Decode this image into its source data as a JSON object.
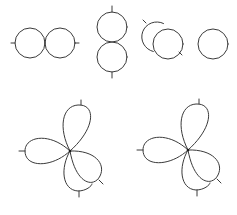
{
  "diagram": {
    "background": "#ffffff",
    "stroke_color": "#3a3a3a",
    "row1": {
      "pair_horizontal": {
        "circles": [
          {
            "cx": 30,
            "cy": 43,
            "r": 15
          },
          {
            "cx": 60,
            "cy": 43,
            "r": 15
          }
        ],
        "ticks": [
          {
            "x1": 11,
            "y1": 43,
            "x2": 15,
            "y2": 43
          },
          {
            "x1": 75,
            "y1": 43,
            "x2": 79,
            "y2": 43
          }
        ]
      },
      "pair_vertical": {
        "circles": [
          {
            "cx": 112,
            "cy": 27,
            "r": 15
          },
          {
            "cx": 112,
            "cy": 57,
            "r": 15
          }
        ],
        "ticks": [
          {
            "x1": 112,
            "y1": 6,
            "x2": 112,
            "y2": 12
          },
          {
            "x1": 112,
            "y1": 72,
            "x2": 112,
            "y2": 78
          }
        ]
      },
      "pair_overlapping": {
        "circles": [
          {
            "cx": 157,
            "cy": 37,
            "r": 15
          },
          {
            "cx": 168,
            "cy": 44,
            "r": 15
          }
        ],
        "ticks": [
          {
            "x1": 143,
            "y1": 20,
            "x2": 146,
            "y2": 23
          },
          {
            "x1": 179,
            "y1": 52,
            "x2": 182,
            "y2": 55
          }
        ]
      },
      "single": {
        "circles": [
          {
            "cx": 213,
            "cy": 44,
            "r": 15
          }
        ],
        "ticks": []
      }
    },
    "row2": {
      "clovers": [
        {
          "name": "left",
          "center": {
            "x": 70,
            "y": 151
          },
          "dx": 0
        },
        {
          "name": "right",
          "center": {
            "x": 188,
            "y": 150
          },
          "dx": 118
        }
      ]
    }
  }
}
